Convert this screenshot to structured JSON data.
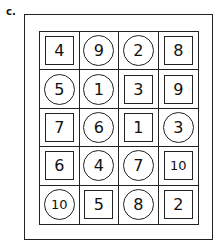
{
  "label": "c.",
  "grid": {
    "rows": 5,
    "cols": 4,
    "cells": [
      [
        {
          "value": "4",
          "shape": "square"
        },
        {
          "value": "9",
          "shape": "circle"
        },
        {
          "value": "2",
          "shape": "circle"
        },
        {
          "value": "8",
          "shape": "square"
        }
      ],
      [
        {
          "value": "5",
          "shape": "circle"
        },
        {
          "value": "1",
          "shape": "circle"
        },
        {
          "value": "3",
          "shape": "square"
        },
        {
          "value": "9",
          "shape": "square"
        }
      ],
      [
        {
          "value": "7",
          "shape": "square"
        },
        {
          "value": "6",
          "shape": "circle"
        },
        {
          "value": "1",
          "shape": "square"
        },
        {
          "value": "3",
          "shape": "circle"
        }
      ],
      [
        {
          "value": "6",
          "shape": "square"
        },
        {
          "value": "4",
          "shape": "circle"
        },
        {
          "value": "7",
          "shape": "circle"
        },
        {
          "value": "10",
          "shape": "square"
        }
      ],
      [
        {
          "value": "10",
          "shape": "circle"
        },
        {
          "value": "5",
          "shape": "square"
        },
        {
          "value": "8",
          "shape": "circle"
        },
        {
          "value": "2",
          "shape": "square"
        }
      ]
    ]
  }
}
